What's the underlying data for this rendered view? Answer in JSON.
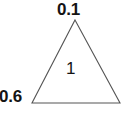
{
  "diagram": {
    "type": "triangle-with-labels",
    "background_color": "#ffffff",
    "stroke_color": "#555555",
    "text_color": "#141414",
    "vertices": {
      "apex": {
        "x": 75,
        "y": 20
      },
      "bottom_left": {
        "x": 32,
        "y": 103
      },
      "bottom_right": {
        "x": 120,
        "y": 103
      }
    },
    "labels": {
      "apex": "0.1",
      "bottom_left": "0.6",
      "center": "1"
    }
  }
}
